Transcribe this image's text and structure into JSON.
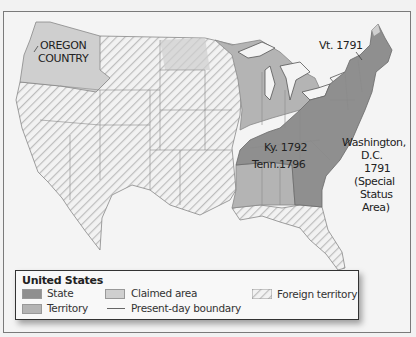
{
  "map": {
    "labels": {
      "oregon": "OREGON\nCOUNTRY",
      "oregon_line1": "OREGON",
      "oregon_line2": "COUNTRY",
      "vermont": "Vt. 1791",
      "kentucky": "Ky. 1792",
      "tennessee": "Tenn.1796",
      "dc_line1": "Washington,",
      "dc_line2": "D.C.",
      "dc_line3": "1791",
      "dc_line4": "(Special",
      "dc_line5": "Status",
      "dc_line6": "Area)"
    },
    "colors": {
      "state": "#8f8f8f",
      "territory": "#b4b4b4",
      "claimed": "#cfcfcf",
      "foreign_hatch": "#b8b8b8",
      "water": "#f4f4f4",
      "border": "#777777"
    }
  },
  "legend": {
    "title": "United States",
    "items": [
      {
        "label": "State",
        "swatch": "state"
      },
      {
        "label": "Territory",
        "swatch": "territory"
      },
      {
        "label": "Claimed area",
        "swatch": "claimed"
      },
      {
        "label": "Present-day boundary",
        "swatch": "line"
      },
      {
        "label": "Foreign territory",
        "swatch": "hatch"
      }
    ]
  }
}
